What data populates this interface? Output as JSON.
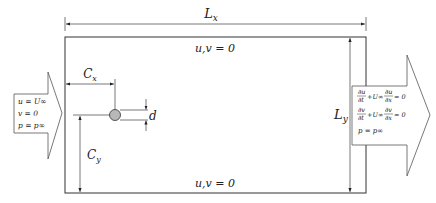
{
  "diagram": {
    "type": "flow-domain-schematic",
    "dimensions": {
      "length_label": "L",
      "length_sub": "x",
      "height_label": "L",
      "height_sub": "y",
      "cx_label": "C",
      "cx_sub": "x",
      "cy_label": "C",
      "cy_sub": "y",
      "diameter_label": "d"
    },
    "walls": {
      "top_bc": "u,v = 0",
      "bottom_bc": "u,v = 0"
    },
    "inlet": {
      "line1": "u = U∞",
      "line2": "v = 0",
      "line3": "p = p∞"
    },
    "outlet": {
      "eq1_a_num": "∂u",
      "eq1_a_den": "∂t",
      "eq1_mid": "+U∞",
      "eq1_b_num": "∂u",
      "eq1_b_den": "∂x",
      "eq1_rhs": "= 0",
      "eq2_a_num": "∂v",
      "eq2_a_den": "∂t",
      "eq2_mid": "+U∞",
      "eq2_b_num": "∂v",
      "eq2_b_den": "∂x",
      "eq2_rhs": "= 0",
      "line3": "p = p∞"
    },
    "colors": {
      "cylinder_fill": "#b8b8b8",
      "line": "#333333",
      "background": "#ffffff"
    }
  }
}
